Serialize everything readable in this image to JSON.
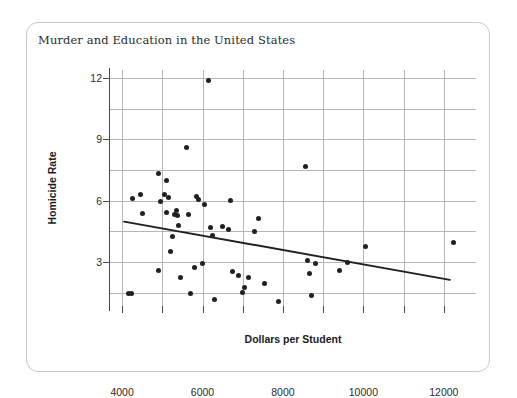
{
  "chart_data": {
    "type": "scatter",
    "title": "Murder and Education in the United States",
    "xlabel": "Dollars per Student",
    "ylabel": "Homicide Rate",
    "xlim": [
      3700,
      12800
    ],
    "ylim": [
      0.85,
      12.4
    ],
    "xticks": [
      4000,
      6000,
      8000,
      10000,
      12000
    ],
    "xtick_labels": [
      "4000",
      "6000",
      "8000",
      "10000",
      "12000"
    ],
    "x_minor_gridlines": [
      4000,
      5000,
      6000,
      7000,
      8000,
      9000,
      10000,
      11000,
      12000
    ],
    "yticks": [
      3,
      6,
      9,
      12
    ],
    "ytick_labels": [
      "3",
      "6",
      "9",
      "12"
    ],
    "y_gridlines": [
      1.5,
      3,
      4.5,
      6,
      7.5,
      9,
      10.5,
      12
    ],
    "grid": true,
    "legend": "none",
    "point_color": "#231f20",
    "line_color": "#231f20",
    "points": [
      {
        "x": 4150,
        "y": 1.45
      },
      {
        "x": 4230,
        "y": 1.45
      },
      {
        "x": 4250,
        "y": 6.1
      },
      {
        "x": 4450,
        "y": 6.3
      },
      {
        "x": 4500,
        "y": 5.4
      },
      {
        "x": 4900,
        "y": 7.35
      },
      {
        "x": 4950,
        "y": 5.95
      },
      {
        "x": 4900,
        "y": 2.6
      },
      {
        "x": 5050,
        "y": 6.3
      },
      {
        "x": 5100,
        "y": 7.0
      },
      {
        "x": 5100,
        "y": 5.45
      },
      {
        "x": 5150,
        "y": 6.15
      },
      {
        "x": 5200,
        "y": 3.5
      },
      {
        "x": 5250,
        "y": 4.25
      },
      {
        "x": 5300,
        "y": 5.35
      },
      {
        "x": 5350,
        "y": 5.5
      },
      {
        "x": 5380,
        "y": 5.3
      },
      {
        "x": 5400,
        "y": 4.8
      },
      {
        "x": 5450,
        "y": 2.25
      },
      {
        "x": 5600,
        "y": 8.6
      },
      {
        "x": 5650,
        "y": 5.35
      },
      {
        "x": 5700,
        "y": 1.45
      },
      {
        "x": 5800,
        "y": 2.75
      },
      {
        "x": 5850,
        "y": 6.2
      },
      {
        "x": 5900,
        "y": 6.05
      },
      {
        "x": 6000,
        "y": 2.95
      },
      {
        "x": 6050,
        "y": 5.8
      },
      {
        "x": 6150,
        "y": 11.9
      },
      {
        "x": 6200,
        "y": 4.7
      },
      {
        "x": 6250,
        "y": 4.3
      },
      {
        "x": 6300,
        "y": 1.15
      },
      {
        "x": 6500,
        "y": 4.75
      },
      {
        "x": 6650,
        "y": 4.6
      },
      {
        "x": 6700,
        "y": 6.0
      },
      {
        "x": 6750,
        "y": 2.55
      },
      {
        "x": 6900,
        "y": 2.35
      },
      {
        "x": 7000,
        "y": 1.5
      },
      {
        "x": 7050,
        "y": 1.75
      },
      {
        "x": 7150,
        "y": 2.25
      },
      {
        "x": 7300,
        "y": 4.5
      },
      {
        "x": 7400,
        "y": 5.15
      },
      {
        "x": 7550,
        "y": 1.95
      },
      {
        "x": 7900,
        "y": 1.05
      },
      {
        "x": 8550,
        "y": 7.7
      },
      {
        "x": 8600,
        "y": 3.1
      },
      {
        "x": 8650,
        "y": 2.45
      },
      {
        "x": 8700,
        "y": 1.35
      },
      {
        "x": 8800,
        "y": 2.95
      },
      {
        "x": 9400,
        "y": 2.6
      },
      {
        "x": 9600,
        "y": 2.98
      },
      {
        "x": 10050,
        "y": 3.75
      },
      {
        "x": 12250,
        "y": 3.95
      }
    ],
    "trendline": {
      "x_start": 4050,
      "y_start": 4.98,
      "x_end": 12150,
      "y_end": 2.13
    }
  }
}
